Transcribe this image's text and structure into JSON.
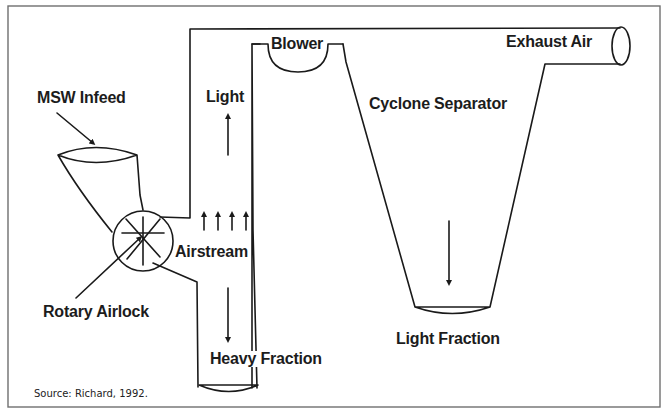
{
  "diagram": {
    "labels": {
      "msw_infeed": "MSW Infeed",
      "light": "Light",
      "blower": "Blower",
      "exhaust_air": "Exhaust Air",
      "cyclone_separator": "Cyclone Separator",
      "airstream": "Airstream",
      "rotary_airlock": "Rotary Airlock",
      "heavy_fraction": "Heavy Fraction",
      "light_fraction": "Light Fraction"
    },
    "source": "Source: Richard, 1992.",
    "colors": {
      "line": "#1a1a1a",
      "frame": "#6f6f6f",
      "background": "#ffffff"
    }
  }
}
